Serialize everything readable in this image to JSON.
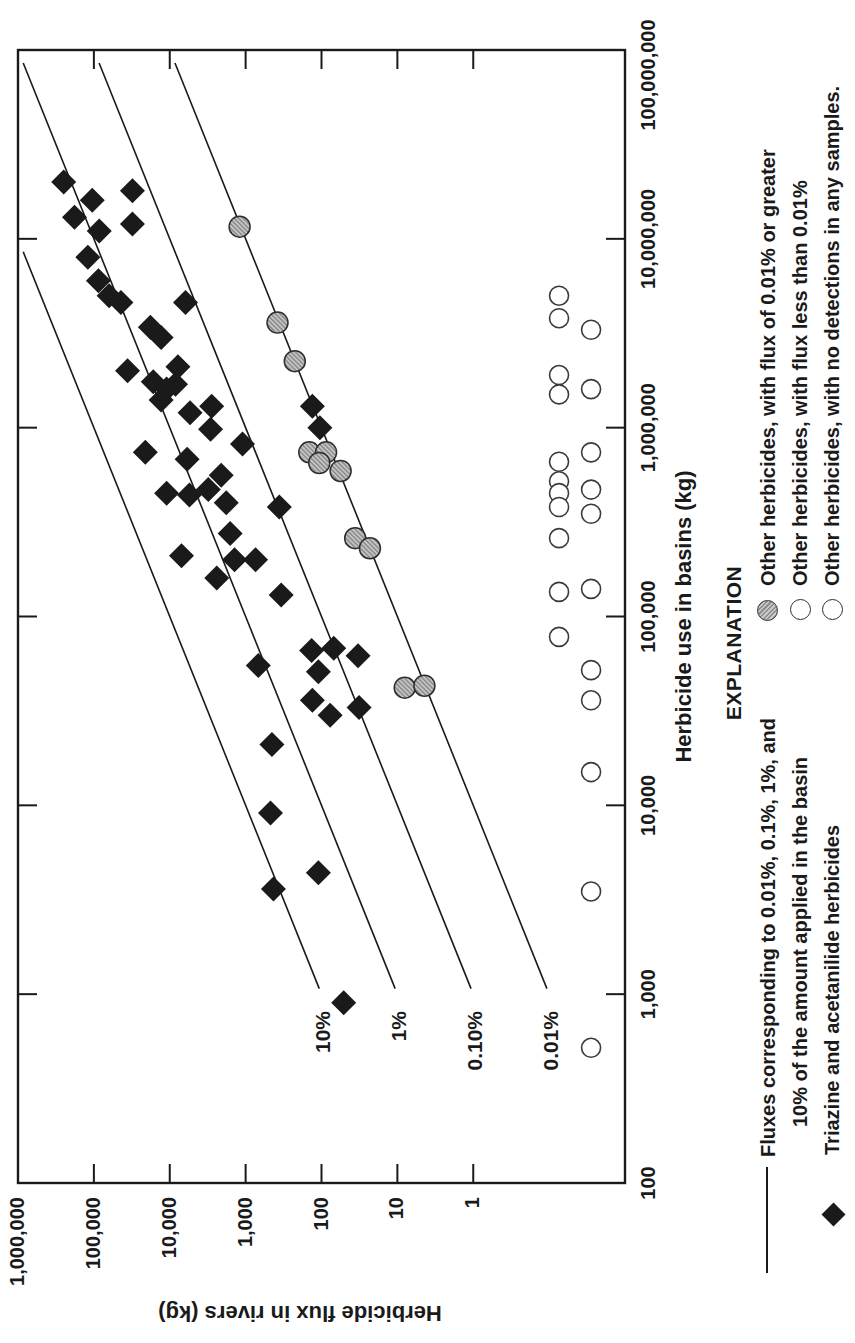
{
  "figure": {
    "orientation": "landscape chart rotated 90 degrees counter-clockwise on portrait page",
    "ink_color": "#1a1a1a",
    "paper_color": "#ffffff"
  },
  "legend": {
    "title": "EXPLANATION",
    "items": [
      {
        "symbol": "line",
        "label_line1": "Fluxes corresponding to 0.01%, 0.1%, 1%, and",
        "label_line2": "10% of the amount applied in the basin"
      },
      {
        "symbol": "black-diamond",
        "label": "Triazine and acetanilide herbicides"
      },
      {
        "symbol": "gray-circle",
        "label": "Other herbicides, with flux of 0.01% or greater"
      },
      {
        "symbol": "open-circle",
        "label": "Other herbicides, with flux less than 0.01%"
      },
      {
        "symbol": "open-circle",
        "label": "Other herbicides, with no detections in any samples."
      }
    ]
  },
  "chart_data": {
    "type": "scatter",
    "xlabel": "Herbicide use in basins (kg)",
    "ylabel": "Herbicide flux in rivers (kg)",
    "x_scale": "log",
    "y_scale": "log",
    "xlim": [
      100,
      100000000
    ],
    "ylim": [
      0.01,
      1000000
    ],
    "y_labeled_range": [
      1,
      1000000
    ],
    "x_tick_labels": [
      "100",
      "1,000",
      "10,000",
      "100,000",
      "1,000,000",
      "10,000,000",
      "100,000,000"
    ],
    "x_tick_values": [
      100,
      1000,
      10000,
      100000,
      1000000,
      10000000,
      100000000
    ],
    "y_tick_labels": [
      "1",
      "10",
      "100",
      "1,000",
      "10,000",
      "100,000",
      "1,000,000"
    ],
    "y_tick_values": [
      1,
      10,
      100,
      1000,
      10000,
      100000,
      1000000
    ],
    "grid": false,
    "reference_lines_note": "Diagonal lines of constant flux/use ratio, drawn from use = 1070 kg up to the frame edge",
    "ref_line_start_use": 1070,
    "reference_lines": [
      {
        "label": "10%",
        "fraction": 0.1
      },
      {
        "label": "1%",
        "fraction": 0.01
      },
      {
        "label": "0.10%",
        "fraction": 0.001
      },
      {
        "label": "0.01%",
        "fraction": 0.0001
      }
    ],
    "series": [
      {
        "name": "Triazine and acetanilide herbicides",
        "marker": "diamond",
        "color": "#1a1a1a",
        "points": [
          [
            20000000,
            250000
          ],
          [
            16000000,
            105000
          ],
          [
            13000000,
            180000
          ],
          [
            11000000,
            85000
          ],
          [
            18000000,
            31000
          ],
          [
            12000000,
            31000
          ],
          [
            8000000,
            120000
          ],
          [
            6000000,
            87000
          ],
          [
            5000000,
            63000
          ],
          [
            4600000,
            44000
          ],
          [
            4600000,
            6200
          ],
          [
            3400000,
            18000
          ],
          [
            3000000,
            13000
          ],
          [
            2000000,
            36000
          ],
          [
            2100000,
            7800
          ],
          [
            1750000,
            16500
          ],
          [
            1600000,
            11000
          ],
          [
            1700000,
            8400
          ],
          [
            1400000,
            13000
          ],
          [
            1200000,
            5400
          ],
          [
            1300000,
            2800
          ],
          [
            980000,
            2900
          ],
          [
            820000,
            1100
          ],
          [
            740000,
            21000
          ],
          [
            680000,
            5900
          ],
          [
            560000,
            2100
          ],
          [
            450000,
            11000
          ],
          [
            440000,
            5500
          ],
          [
            470000,
            3100
          ],
          [
            400000,
            1800
          ],
          [
            275000,
            1600
          ],
          [
            200000,
            1400
          ],
          [
            200000,
            740
          ],
          [
            210000,
            7000
          ],
          [
            160000,
            2400
          ],
          [
            55000,
            680
          ],
          [
            380000,
            360
          ],
          [
            130000,
            340
          ],
          [
            1300000,
            132
          ],
          [
            1000000,
            105
          ],
          [
            66000,
            135
          ],
          [
            68000,
            69
          ],
          [
            62000,
            33
          ],
          [
            51000,
            110
          ],
          [
            36000,
            132
          ],
          [
            30000,
            77
          ],
          [
            33000,
            32
          ],
          [
            4400,
            110
          ],
          [
            900,
            51
          ],
          [
            21000,
            450
          ],
          [
            9100,
            470
          ],
          [
            3600,
            430
          ]
        ]
      },
      {
        "name": "Other herbicides, with flux of 0.01% or greater",
        "marker": "gray-circle",
        "fill": "#a8a8a8",
        "stroke": "#2e2e2e",
        "points": [
          [
            11600000,
            1200
          ],
          [
            3600000,
            380
          ],
          [
            2250000,
            225
          ],
          [
            740000,
            145
          ],
          [
            740000,
            87
          ],
          [
            650000,
            107
          ],
          [
            590000,
            56
          ],
          [
            260000,
            36
          ],
          [
            230000,
            23
          ],
          [
            42000,
            8
          ],
          [
            43000,
            4.4
          ]
        ]
      },
      {
        "name": "Other herbicides, with flux less than 0.01%",
        "marker": "open-circle",
        "fill": "#ffffff",
        "stroke": "#3a3a3a",
        "plotted_below_scale": true,
        "row_flux": 0.074,
        "points": [
          [
            5000000,
            0.074
          ],
          [
            3800000,
            0.074
          ],
          [
            1900000,
            0.074
          ],
          [
            1500000,
            0.074
          ],
          [
            660000,
            0.074
          ],
          [
            520000,
            0.074
          ],
          [
            450000,
            0.074
          ],
          [
            380000,
            0.074
          ],
          [
            260000,
            0.074
          ],
          [
            135000,
            0.074
          ],
          [
            78000,
            0.074
          ]
        ]
      },
      {
        "name": "Other herbicides, with no detections in any samples.",
        "marker": "open-circle",
        "fill": "#ffffff",
        "stroke": "#3a3a3a",
        "plotted_below_scale": true,
        "row_flux": 0.028,
        "points": [
          [
            3300000,
            0.028
          ],
          [
            1600000,
            0.028
          ],
          [
            740000,
            0.028
          ],
          [
            470000,
            0.028
          ],
          [
            350000,
            0.028
          ],
          [
            140000,
            0.028
          ],
          [
            52000,
            0.028
          ],
          [
            36000,
            0.028
          ],
          [
            15000,
            0.028
          ],
          [
            3500,
            0.028
          ],
          [
            520,
            0.028
          ]
        ]
      }
    ]
  }
}
